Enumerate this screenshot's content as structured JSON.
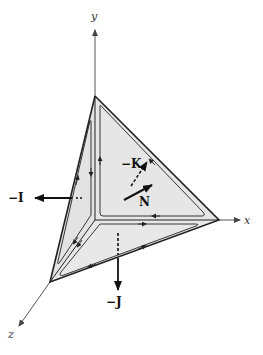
{
  "figure": {
    "colors": {
      "face_fill": "#e6e6e6",
      "edge": "#222222",
      "axis": "#555555",
      "vector": "#111111"
    },
    "axes": {
      "x": {
        "label": "x"
      },
      "y": {
        "label": "y"
      },
      "z": {
        "label": "z"
      }
    },
    "vectors": [
      {
        "name": "neg-I",
        "label": "−I",
        "direction": "left (−x face normal)"
      },
      {
        "name": "neg-J",
        "label": "−J",
        "direction": "down (−y face normal)"
      },
      {
        "name": "neg-K",
        "label": "−K",
        "direction": "dashed, into page (−z face normal)"
      },
      {
        "name": "N",
        "label": "N",
        "direction": "outward normal of slanted face"
      }
    ]
  }
}
